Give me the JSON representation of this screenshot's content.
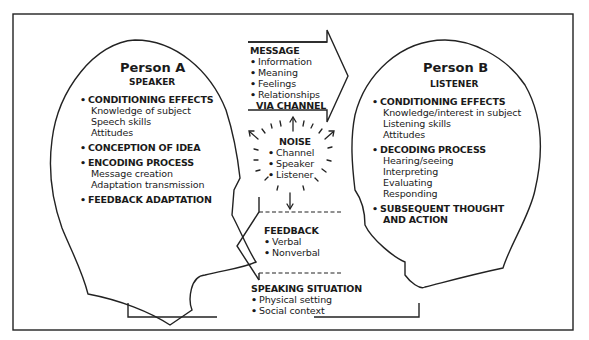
{
  "colors": {
    "background": "#ffffff",
    "stroke": "#222222",
    "text": "#1a1a1a"
  },
  "person_a": {
    "title": "Person A",
    "role": "SPEAKER",
    "sections": [
      {
        "heading": "CONDITIONING EFFECTS",
        "items": [
          "Knowledge of subject",
          "Speech skills",
          "Attitudes"
        ]
      },
      {
        "heading": "CONCEPTION OF IDEA",
        "items": []
      },
      {
        "heading": "ENCODING PROCESS",
        "items": [
          "Message creation",
          "Adaptation transmission"
        ]
      },
      {
        "heading": "FEEDBACK ADAPTATION",
        "items": []
      }
    ]
  },
  "person_b": {
    "title": "Person B",
    "role": "LISTENER",
    "sections": [
      {
        "heading": "CONDITIONING EFFECTS",
        "items": [
          "Knowledge/interest in subject",
          "Listening skills",
          "Attitudes"
        ]
      },
      {
        "heading": "DECODING PROCESS",
        "items": [
          "Hearing/seeing",
          "Interpreting",
          "Evaluating",
          "Responding"
        ]
      },
      {
        "heading": "SUBSEQUENT THOUGHT",
        "heading_line2": "AND ACTION",
        "items": []
      }
    ]
  },
  "message": {
    "heading": "MESSAGE",
    "items": [
      "Information",
      "Meaning",
      "Feelings",
      "Relationships"
    ],
    "channel_label": "VIA CHANNEL"
  },
  "noise": {
    "heading": "NOISE",
    "items": [
      "Channel",
      "Speaker",
      "Listener"
    ]
  },
  "feedback": {
    "heading": "FEEDBACK",
    "items": [
      "Verbal",
      "Nonverbal"
    ]
  },
  "speaking_situation": {
    "heading": "SPEAKING SITUATION",
    "items": [
      "Physical setting",
      "Social context"
    ]
  }
}
